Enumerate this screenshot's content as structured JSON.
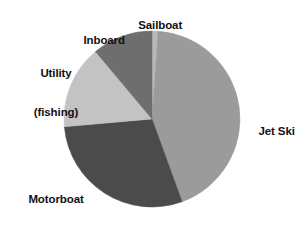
{
  "chart_data": {
    "type": "pie",
    "title": "",
    "subtitle": "",
    "xlabel": "",
    "ylabel": "",
    "legend_position": "none",
    "grid": false,
    "labels_outside": true,
    "start_angle_deg": 0,
    "direction": "clockwise",
    "center": {
      "x": 152,
      "y": 119
    },
    "radius": 88,
    "categories": [
      "Sailboat",
      "Jet Ski",
      "Motorboat",
      "Utility (fishing)",
      "Inboard"
    ],
    "values": [
      1.1,
      43.3,
      29.2,
      15.3,
      11.1
    ],
    "slices": [
      {
        "label": "Sailboat",
        "label_lines": [
          "Sailboat"
        ],
        "value": 1.1,
        "start_angle_deg": 0,
        "end_angle_deg": 4,
        "color": "#b8b8b8"
      },
      {
        "label": "Jet Ski",
        "label_lines": [
          "Jet Ski"
        ],
        "value": 43.3,
        "start_angle_deg": 4,
        "end_angle_deg": 160,
        "color": "#9b9b9b"
      },
      {
        "label": "Motorboat",
        "label_lines": [
          "Motorboat"
        ],
        "value": 29.2,
        "start_angle_deg": 160,
        "end_angle_deg": 265,
        "color": "#4b4b4b"
      },
      {
        "label": "Utility (fishing)",
        "label_lines": [
          "Utility",
          "(fishing)"
        ],
        "value": 15.3,
        "start_angle_deg": 265,
        "end_angle_deg": 320,
        "color": "#c3c3c3"
      },
      {
        "label": "Inboard",
        "label_lines": [
          "Inboard"
        ],
        "value": 11.1,
        "start_angle_deg": 320,
        "end_angle_deg": 360,
        "color": "#6e6e6e"
      }
    ]
  },
  "labels": {
    "sailboat": "Sailboat",
    "inboard": "Inboard",
    "utility_line1": "Utility",
    "utility_line2": "(fishing)",
    "motorboat": "Motorboat",
    "jetski": "Jet Ski"
  },
  "colors": {
    "background": "#ffffff",
    "text": "#111111",
    "sailboat": "#b8b8b8",
    "jetski": "#9b9b9b",
    "motorboat": "#4b4b4b",
    "utility": "#c3c3c3",
    "inboard": "#6e6e6e"
  }
}
